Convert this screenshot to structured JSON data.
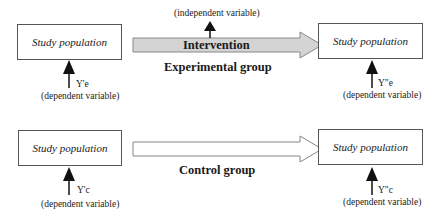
{
  "diagram": {
    "experimental": {
      "group_label": "Experimental group",
      "intervention_label": "Intervention",
      "independent_label": "(independent variable)",
      "before_box": "Study population",
      "after_box": "Study population",
      "before_measure": "Y'e",
      "after_measure": "Y\"e",
      "before_dependent": "(dependent variable)",
      "after_dependent": "(dependent variable)",
      "arrow_fill": "#d4d4d4"
    },
    "control": {
      "group_label": "Control group",
      "before_box": "Study population",
      "after_box": "Study population",
      "before_measure": "Y'c",
      "after_measure": "Y\"c",
      "before_dependent": "(dependent variable)",
      "after_dependent": "(dependent variable)",
      "arrow_fill": "#ffffff"
    }
  }
}
